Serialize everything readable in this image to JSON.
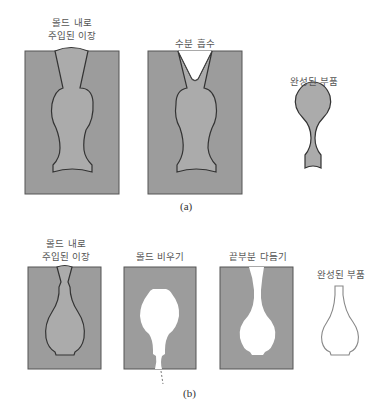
{
  "panel_a": {
    "caption": "(a)",
    "labels": {
      "poured_slip": "몰드 내로\n주입된 이장",
      "water_absorption": "수분 흡수",
      "finished_part": "완성된 부품"
    }
  },
  "panel_b": {
    "caption": "(b)",
    "labels": {
      "poured_slip": "몰드 내로\n주입된 이장",
      "drain_mold": "몰드 비우기",
      "trim_top": "끝부분 다듬기",
      "finished_part": "완성된 부품"
    }
  },
  "colors": {
    "mold": "#9c9c9c",
    "slip": "#ababab",
    "outline": "#3a3a3a",
    "hollow": "#ffffff"
  }
}
